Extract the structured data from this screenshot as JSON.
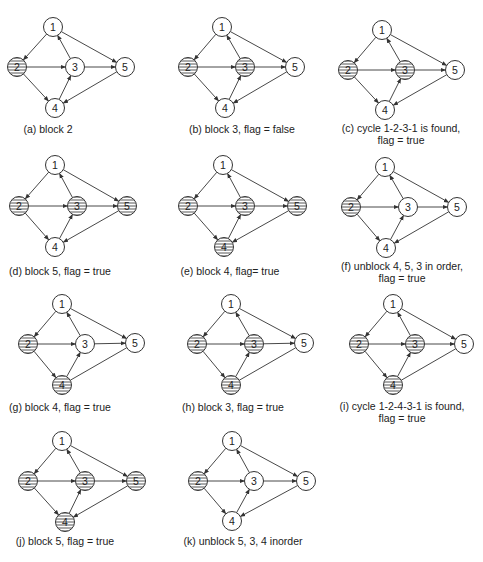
{
  "figure": {
    "node_radius": 9.5,
    "colors": {
      "stroke": "#333333",
      "fill": "#ffffff",
      "hatch": "#444444",
      "text": "#222222",
      "background": "#ffffff"
    },
    "edges": [
      {
        "from": "1",
        "to": "2"
      },
      {
        "from": "1",
        "to": "5"
      },
      {
        "from": "2",
        "to": "3"
      },
      {
        "from": "2",
        "to": "4"
      },
      {
        "from": "3",
        "to": "1"
      },
      {
        "from": "3",
        "to": "5"
      },
      {
        "from": "4",
        "to": "3"
      },
      {
        "from": "5",
        "to": "4"
      }
    ],
    "panels": [
      {
        "id": "a",
        "caption": [
          "(a) block 2"
        ],
        "caption_pos": [
          [
            48,
            133
          ]
        ],
        "nodes": {
          "1": [
            53,
            27
          ],
          "2": [
            17,
            67
          ],
          "3": [
            75,
            67
          ],
          "4": [
            55,
            108
          ],
          "5": [
            125,
            67
          ]
        },
        "blocked": [
          "2"
        ],
        "no_arrow_edges": []
      },
      {
        "id": "b",
        "caption": [
          "(b) block 3, flag = false"
        ],
        "caption_pos": [
          [
            242,
            133
          ]
        ],
        "nodes": {
          "1": [
            222,
            27
          ],
          "2": [
            188,
            67
          ],
          "3": [
            245,
            67
          ],
          "4": [
            225,
            108
          ],
          "5": [
            295,
            67
          ]
        },
        "blocked": [
          "2",
          "3"
        ],
        "no_arrow_edges": []
      },
      {
        "id": "c",
        "caption": [
          "(c) cycle 1-2-3-1 is found,",
          "flag = true"
        ],
        "caption_pos": [
          [
            401,
            132
          ],
          [
            401,
            144
          ]
        ],
        "nodes": {
          "1": [
            382,
            30
          ],
          "2": [
            348,
            70
          ],
          "3": [
            405,
            70
          ],
          "4": [
            385,
            110
          ],
          "5": [
            455,
            70
          ]
        },
        "blocked": [
          "2",
          "3"
        ],
        "no_arrow_edges": []
      },
      {
        "id": "d",
        "caption": [
          "(d) block 5, flag = true"
        ],
        "caption_pos": [
          [
            60,
            275
          ]
        ],
        "nodes": {
          "1": [
            55,
            165
          ],
          "2": [
            19,
            206
          ],
          "3": [
            77,
            206
          ],
          "4": [
            55,
            247
          ],
          "5": [
            127,
            206
          ]
        },
        "blocked": [
          "2",
          "3",
          "5"
        ],
        "no_arrow_edges": []
      },
      {
        "id": "e",
        "caption": [
          "(e) block 4, flag= true"
        ],
        "caption_pos": [
          [
            230,
            275
          ]
        ],
        "nodes": {
          "1": [
            223,
            165
          ],
          "2": [
            188,
            206
          ],
          "3": [
            245,
            206
          ],
          "4": [
            224,
            247
          ],
          "5": [
            297,
            206
          ]
        },
        "blocked": [
          "2",
          "3",
          "4",
          "5"
        ],
        "no_arrow_edges": []
      },
      {
        "id": "f",
        "caption": [
          "(f) unblock 4, 5, 3 in order,",
          "flag = true"
        ],
        "caption_pos": [
          [
            402,
            270
          ],
          [
            402,
            282
          ]
        ],
        "nodes": {
          "1": [
            385,
            167
          ],
          "2": [
            351,
            207
          ],
          "3": [
            408,
            207
          ],
          "4": [
            386,
            248
          ],
          "5": [
            457,
            207
          ]
        },
        "blocked": [
          "2"
        ],
        "no_arrow_edges": []
      },
      {
        "id": "g",
        "caption": [
          "(g) block 4, flag = true"
        ],
        "caption_pos": [
          [
            60,
            411
          ]
        ],
        "nodes": {
          "1": [
            62,
            304
          ],
          "2": [
            28,
            344
          ],
          "3": [
            85,
            344
          ],
          "4": [
            62,
            385
          ],
          "5": [
            135,
            343
          ]
        },
        "blocked": [
          "2",
          "4"
        ],
        "no_arrow_edges": [
          [
            "5",
            "4"
          ]
        ]
      },
      {
        "id": "h",
        "caption": [
          "(h) block 3, flag = true"
        ],
        "caption_pos": [
          [
            233,
            411
          ]
        ],
        "nodes": {
          "1": [
            231,
            304
          ],
          "2": [
            197,
            344
          ],
          "3": [
            254,
            344
          ],
          "4": [
            231,
            385
          ],
          "5": [
            304,
            343
          ]
        },
        "blocked": [
          "2",
          "3",
          "4"
        ],
        "no_arrow_edges": [
          [
            "5",
            "4"
          ]
        ]
      },
      {
        "id": "i",
        "caption": [
          "(i) cycle 1-2-4-3-1 is found,",
          "flag = true"
        ],
        "caption_pos": [
          [
            402,
            410
          ],
          [
            402,
            422
          ]
        ],
        "nodes": {
          "1": [
            393,
            304
          ],
          "2": [
            359,
            344
          ],
          "3": [
            415,
            344
          ],
          "4": [
            393,
            385
          ],
          "5": [
            464,
            344
          ]
        },
        "blocked": [
          "2",
          "3",
          "4"
        ],
        "no_arrow_edges": [
          [
            "5",
            "4"
          ]
        ]
      },
      {
        "id": "j",
        "caption": [
          "(j) block 5, flag = true"
        ],
        "caption_pos": [
          [
            65,
            545
          ]
        ],
        "nodes": {
          "1": [
            62,
            441
          ],
          "2": [
            28,
            481
          ],
          "3": [
            85,
            481
          ],
          "4": [
            65,
            522
          ],
          "5": [
            136,
            481
          ]
        },
        "blocked": [
          "2",
          "3",
          "4",
          "5"
        ],
        "no_arrow_edges": []
      },
      {
        "id": "k",
        "caption": [
          "(k) unblock 5, 3, 4 inorder"
        ],
        "caption_pos": [
          [
            243,
            545
          ]
        ],
        "nodes": {
          "1": [
            232,
            441
          ],
          "2": [
            198,
            481
          ],
          "3": [
            254,
            481
          ],
          "4": [
            232,
            521
          ],
          "5": [
            306,
            481
          ]
        },
        "blocked": [
          "2"
        ],
        "no_arrow_edges": []
      }
    ]
  }
}
